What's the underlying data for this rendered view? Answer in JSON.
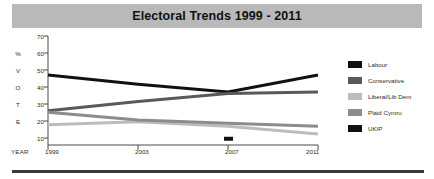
{
  "banner": {
    "title": "Electoral Trends 1999 - 2011"
  },
  "chart_data": {
    "type": "line",
    "title": "Electoral Trends 1999 - 2011",
    "xlabel": "YEAR",
    "ylabel": "% VOTE",
    "ylabel_letters": [
      "%",
      "V",
      "O",
      "T",
      "E"
    ],
    "x": [
      1999,
      2003,
      2007,
      2011
    ],
    "categories": [
      "1999",
      "2003",
      "2007",
      "2011"
    ],
    "xlim": [
      1999,
      2011
    ],
    "ylim": [
      0,
      70
    ],
    "yticks": [
      70,
      60,
      50,
      40,
      30,
      20,
      10
    ],
    "ytick_labels": [
      "70",
      "60",
      "50",
      "40",
      "30",
      "20",
      "10"
    ],
    "xticks": [
      1999,
      2003,
      2007,
      2011
    ],
    "xtick_labels": [
      "1999",
      "2003",
      "2007",
      "2011"
    ],
    "grid": false,
    "legend_position": "right",
    "series": [
      {
        "name": "Labour",
        "color": "#111111",
        "values": [
          45,
          39,
          34,
          45
        ],
        "marker": false
      },
      {
        "name": "Conservative",
        "color": "#5a5a5a",
        "values": [
          22,
          28,
          33,
          34
        ],
        "marker": false
      },
      {
        "name": "Liberal/Lib Dem",
        "color": "#bcbcbc",
        "values": [
          13,
          15,
          12,
          7
        ],
        "marker": false
      },
      {
        "name": "Plaid Cymru",
        "color": "#8c8c8c",
        "values": [
          21,
          16,
          14,
          12
        ],
        "marker": false
      },
      {
        "name": "UKIP",
        "color": "#111111",
        "values": [
          null,
          null,
          4,
          null
        ],
        "marker": true
      }
    ]
  },
  "legend": {
    "items": [
      {
        "label": "Labour",
        "color": "#111111"
      },
      {
        "label": "Conservative",
        "color": "#5a5a5a"
      },
      {
        "label": "Liberal/Lib Dem",
        "color": "#bcbcbc"
      },
      {
        "label": "Plaid Cymru",
        "color": "#8c8c8c"
      },
      {
        "label": "UKIP",
        "color": "#111111"
      }
    ]
  }
}
